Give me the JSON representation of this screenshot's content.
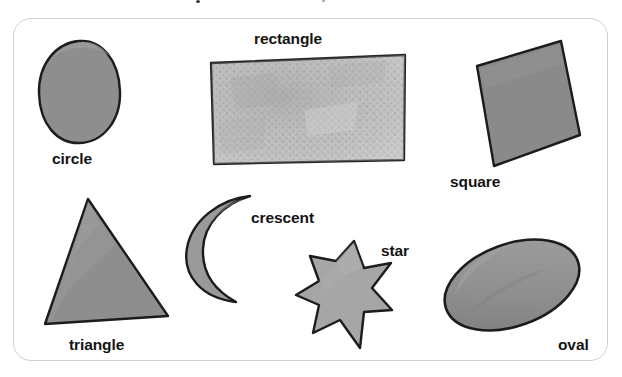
{
  "page": {
    "background_color": "#ffffff",
    "frame_border_color": "#cfcfcf",
    "label_color": "#141414"
  },
  "colors": {
    "outline": "#1c1c1c",
    "solid_gray": "#8e8e8e",
    "solid_gray_dark": "#7c7c7c",
    "light_gray": "#b4b4b4",
    "textured_gray": "#b9b9b9",
    "star_gray": "#a6a6a6"
  },
  "shapes": [
    {
      "id": "circle",
      "label": "circle",
      "icon_name": "circle-shape",
      "fill": "#8e8e8e",
      "label_x": 52,
      "label_y": 151
    },
    {
      "id": "rectangle",
      "label": "rectangle",
      "icon_name": "rectangle-shape",
      "fill": "#b9b9b9",
      "label_x": 254,
      "label_y": 31
    },
    {
      "id": "square",
      "label": "square",
      "icon_name": "square-shape",
      "fill": "#8a8a8a",
      "label_x": 450,
      "label_y": 174
    },
    {
      "id": "triangle",
      "label": "triangle",
      "icon_name": "triangle-shape",
      "fill": "#8e8e8e",
      "label_x": 69,
      "label_y": 337
    },
    {
      "id": "crescent",
      "label": "crescent",
      "icon_name": "crescent-shape",
      "fill": "#9a9a9a",
      "label_x": 251,
      "label_y": 210
    },
    {
      "id": "star",
      "label": "star",
      "icon_name": "star-shape",
      "fill": "#a6a6a6",
      "label_x": 381,
      "label_y": 243
    },
    {
      "id": "oval",
      "label": "oval",
      "icon_name": "oval-shape",
      "fill": "#8a8a8a",
      "label_x": 558,
      "label_y": 337
    }
  ]
}
